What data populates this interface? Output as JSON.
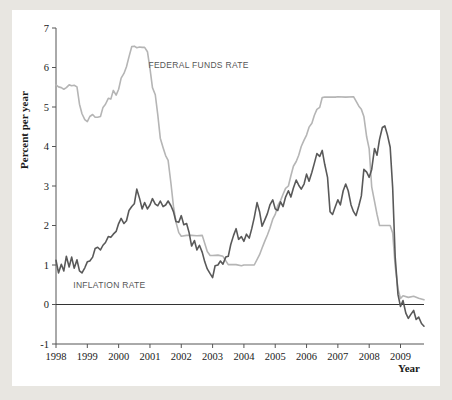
{
  "figure": {
    "background_color": "#e8e6e1",
    "panel_color": "#ffffff"
  },
  "chart_data": {
    "type": "line",
    "title": "",
    "xlabel": "Year",
    "ylabel": "Percent per year",
    "xlim": [
      1998.0,
      2009.75
    ],
    "ylim": [
      -1,
      7
    ],
    "grid": false,
    "legend_position": "inline-annotation",
    "xticks": [
      1998,
      1999,
      2000,
      2001,
      2002,
      2003,
      2004,
      2005,
      2006,
      2007,
      2008,
      2009
    ],
    "xtick_labels": [
      "1998",
      "1999",
      "2000",
      "2001",
      "2002",
      "2003",
      "2004",
      "2005",
      "2006",
      "2007",
      "2008",
      "2009"
    ],
    "yticks": [
      -1,
      0,
      1,
      2,
      3,
      4,
      5,
      6,
      7
    ],
    "ytick_labels": [
      "-1",
      "0",
      "1",
      "2",
      "3",
      "4",
      "5",
      "6",
      "7"
    ],
    "annotations": [
      {
        "text": "FEDERAL FUNDS RATE",
        "x": 2000.95,
        "y": 6.0,
        "color": "#8a8a8a"
      },
      {
        "text": "INFLATION RATE",
        "x": 1998.55,
        "y": 0.42,
        "color": "#6b6b6b"
      }
    ],
    "series": [
      {
        "name": "FEDERAL FUNDS RATE",
        "color": "#b5b5b5",
        "width": 1.6,
        "x": [
          1998.0,
          1998.08,
          1998.17,
          1998.25,
          1998.33,
          1998.42,
          1998.5,
          1998.58,
          1998.67,
          1998.75,
          1998.83,
          1998.92,
          1999.0,
          1999.08,
          1999.17,
          1999.25,
          1999.33,
          1999.42,
          1999.5,
          1999.58,
          1999.67,
          1999.75,
          1999.83,
          1999.92,
          2000.0,
          2000.08,
          2000.17,
          2000.25,
          2000.33,
          2000.42,
          2000.5,
          2000.58,
          2000.67,
          2000.75,
          2000.83,
          2000.92,
          2001.0,
          2001.08,
          2001.17,
          2001.25,
          2001.33,
          2001.42,
          2001.5,
          2001.58,
          2001.67,
          2001.75,
          2001.83,
          2001.92,
          2002.0,
          2002.17,
          2002.33,
          2002.5,
          2002.67,
          2002.83,
          2002.92,
          2003.0,
          2003.17,
          2003.33,
          2003.5,
          2003.58,
          2003.75,
          2003.92,
          2004.0,
          2004.17,
          2004.33,
          2004.5,
          2004.58,
          2004.67,
          2004.75,
          2004.83,
          2004.92,
          2005.0,
          2005.08,
          2005.17,
          2005.25,
          2005.33,
          2005.42,
          2005.5,
          2005.58,
          2005.67,
          2005.75,
          2005.83,
          2005.92,
          2006.0,
          2006.08,
          2006.17,
          2006.25,
          2006.33,
          2006.42,
          2006.5,
          2006.58,
          2006.75,
          2006.92,
          2007.0,
          2007.25,
          2007.5,
          2007.67,
          2007.75,
          2007.83,
          2007.92,
          2008.0,
          2008.08,
          2008.17,
          2008.25,
          2008.33,
          2008.5,
          2008.67,
          2008.75,
          2008.83,
          2008.92,
          2009.0,
          2009.08,
          2009.25,
          2009.42,
          2009.58,
          2009.75
        ],
        "y": [
          5.56,
          5.51,
          5.49,
          5.45,
          5.49,
          5.56,
          5.54,
          5.55,
          5.51,
          5.07,
          4.83,
          4.68,
          4.63,
          4.76,
          4.81,
          4.74,
          4.74,
          4.76,
          4.99,
          5.07,
          5.22,
          5.2,
          5.42,
          5.3,
          5.45,
          5.73,
          5.85,
          6.02,
          6.27,
          6.53,
          6.54,
          6.5,
          6.52,
          6.51,
          6.51,
          6.4,
          5.98,
          5.49,
          5.31,
          4.8,
          4.21,
          3.97,
          3.77,
          3.65,
          3.07,
          2.49,
          2.09,
          1.82,
          1.73,
          1.75,
          1.75,
          1.74,
          1.75,
          1.34,
          1.24,
          1.24,
          1.25,
          1.22,
          1.01,
          1.01,
          1.01,
          0.98,
          1.0,
          1.0,
          1.0,
          1.26,
          1.43,
          1.61,
          1.76,
          1.93,
          2.16,
          2.28,
          2.5,
          2.63,
          2.79,
          2.94,
          3.0,
          3.26,
          3.5,
          3.62,
          3.78,
          4.0,
          4.16,
          4.29,
          4.49,
          4.59,
          4.79,
          4.94,
          4.99,
          5.24,
          5.25,
          5.25,
          5.25,
          5.26,
          5.25,
          5.26,
          5.02,
          4.94,
          4.76,
          4.24,
          3.94,
          2.98,
          2.61,
          2.28,
          2.0,
          2.0,
          2.0,
          1.81,
          0.97,
          0.39,
          0.15,
          0.22,
          0.18,
          0.21,
          0.16,
          0.12
        ]
      },
      {
        "name": "INFLATION RATE",
        "color": "#595959",
        "width": 1.6,
        "x": [
          1998.0,
          1998.08,
          1998.17,
          1998.25,
          1998.33,
          1998.42,
          1998.5,
          1998.58,
          1998.67,
          1998.75,
          1998.83,
          1998.92,
          1999.0,
          1999.08,
          1999.17,
          1999.25,
          1999.33,
          1999.42,
          1999.5,
          1999.58,
          1999.67,
          1999.75,
          1999.83,
          1999.92,
          2000.0,
          2000.08,
          2000.17,
          2000.25,
          2000.33,
          2000.42,
          2000.5,
          2000.58,
          2000.67,
          2000.75,
          2000.83,
          2000.92,
          2001.0,
          2001.08,
          2001.17,
          2001.25,
          2001.33,
          2001.42,
          2001.5,
          2001.58,
          2001.67,
          2001.75,
          2001.83,
          2001.92,
          2002.0,
          2002.08,
          2002.17,
          2002.25,
          2002.33,
          2002.42,
          2002.5,
          2002.58,
          2002.67,
          2002.75,
          2002.83,
          2002.92,
          2003.0,
          2003.08,
          2003.17,
          2003.25,
          2003.33,
          2003.42,
          2003.5,
          2003.58,
          2003.67,
          2003.75,
          2003.83,
          2003.92,
          2004.0,
          2004.08,
          2004.17,
          2004.25,
          2004.33,
          2004.42,
          2004.5,
          2004.58,
          2004.67,
          2004.75,
          2004.83,
          2004.92,
          2005.0,
          2005.08,
          2005.17,
          2005.25,
          2005.33,
          2005.42,
          2005.5,
          2005.58,
          2005.67,
          2005.75,
          2005.83,
          2005.92,
          2006.0,
          2006.08,
          2006.17,
          2006.25,
          2006.33,
          2006.42,
          2006.5,
          2006.58,
          2006.67,
          2006.75,
          2006.83,
          2006.92,
          2007.0,
          2007.08,
          2007.17,
          2007.25,
          2007.33,
          2007.42,
          2007.5,
          2007.58,
          2007.67,
          2007.75,
          2007.83,
          2007.92,
          2008.0,
          2008.08,
          2008.17,
          2008.25,
          2008.33,
          2008.42,
          2008.5,
          2008.58,
          2008.67,
          2008.75,
          2008.83,
          2008.92,
          2009.0,
          2009.08,
          2009.17,
          2009.25,
          2009.33,
          2009.42,
          2009.5,
          2009.58,
          2009.67,
          2009.75
        ],
        "y": [
          1.12,
          0.8,
          1.02,
          0.85,
          1.22,
          0.95,
          1.2,
          0.92,
          1.13,
          0.85,
          0.8,
          0.93,
          1.08,
          1.1,
          1.2,
          1.42,
          1.45,
          1.38,
          1.5,
          1.57,
          1.72,
          1.7,
          1.78,
          1.85,
          2.05,
          2.18,
          2.05,
          2.12,
          2.38,
          2.48,
          2.55,
          2.92,
          2.68,
          2.42,
          2.58,
          2.42,
          2.52,
          2.68,
          2.54,
          2.5,
          2.62,
          2.48,
          2.52,
          2.62,
          2.5,
          2.35,
          2.1,
          2.08,
          2.25,
          2.02,
          2.05,
          1.82,
          1.48,
          1.62,
          1.38,
          1.5,
          1.32,
          1.08,
          0.9,
          0.78,
          0.68,
          0.98,
          1.0,
          1.1,
          1.02,
          1.2,
          1.22,
          1.52,
          1.75,
          1.92,
          1.65,
          1.72,
          1.6,
          1.78,
          1.68,
          1.92,
          2.2,
          2.58,
          2.35,
          1.98,
          2.15,
          2.3,
          2.52,
          2.65,
          2.42,
          2.38,
          2.6,
          2.48,
          2.72,
          2.88,
          2.72,
          2.95,
          3.15,
          3.02,
          2.92,
          3.05,
          3.3,
          3.12,
          3.35,
          3.58,
          3.82,
          3.75,
          3.9,
          3.55,
          3.22,
          2.35,
          2.28,
          2.48,
          2.65,
          2.52,
          2.88,
          3.05,
          2.88,
          2.52,
          2.35,
          2.25,
          2.5,
          2.75,
          3.42,
          3.35,
          3.22,
          3.42,
          3.95,
          3.78,
          4.18,
          4.48,
          4.52,
          4.3,
          3.98,
          2.95,
          1.2,
          0.25,
          -0.05,
          0.1,
          -0.22,
          -0.35,
          -0.25,
          -0.15,
          -0.38,
          -0.32,
          -0.48,
          -0.55
        ]
      }
    ]
  }
}
